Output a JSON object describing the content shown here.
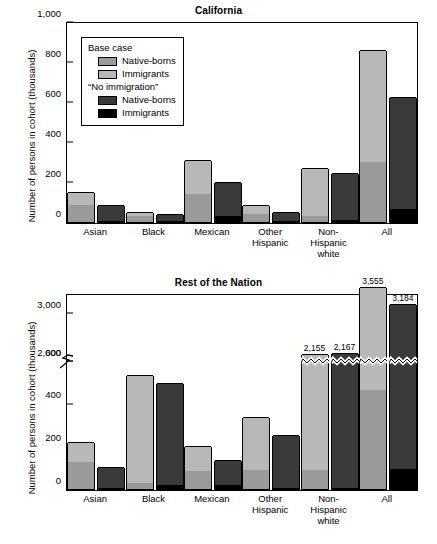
{
  "figure": {
    "ylabel": "Number of persons in cohort (thousands)"
  },
  "legend": {
    "group1_label": "Base case",
    "group1_items": [
      {
        "label": "Native-borns",
        "color": "#9a9a9a",
        "name": "legend-base-native-borns"
      },
      {
        "label": "Immigrants",
        "color": "#b8b8b8",
        "name": "legend-base-immigrants"
      }
    ],
    "group2_label": "“No immigration”",
    "group2_items": [
      {
        "label": "Native-borns",
        "color": "#3a3a3a",
        "name": "legend-noimm-native-borns"
      },
      {
        "label": "Immigrants",
        "color": "#000000",
        "name": "legend-noimm-immigrants"
      }
    ]
  },
  "chart_data": [
    {
      "id": "california",
      "type": "bar",
      "subtype": "grouped-stacked",
      "title": "California",
      "xlabel": "",
      "ylabel": "Number of persons in cohort (thousands)",
      "ylim": [
        0,
        1000
      ],
      "yticks": [
        0,
        200,
        400,
        600,
        800,
        1000
      ],
      "ytick_labels": [
        "0",
        "200",
        "400",
        "600",
        "800",
        "1,000"
      ],
      "grid": false,
      "axis_break": false,
      "categories": [
        "Asian",
        "Black",
        "Mexican",
        "Other\nHispanic",
        "Non-\nHispanic\nwhite",
        "All"
      ],
      "series": [
        {
          "name": "Base case: Native-borns",
          "color": "#9a9a9a",
          "values": [
            85,
            30,
            140,
            40,
            30,
            300
          ]
        },
        {
          "name": "Base case: Immigrants",
          "color": "#b8b8b8",
          "values": [
            65,
            20,
            170,
            45,
            240,
            560
          ]
        },
        {
          "name": "“No immigration”: Native-borns",
          "color": "#3a3a3a",
          "values": [
            78,
            35,
            170,
            47,
            235,
            560
          ]
        },
        {
          "name": "“No immigration”: Immigrants",
          "color": "#000000",
          "values": [
            5,
            3,
            30,
            4,
            8,
            65
          ]
        }
      ],
      "bar_totals": {
        "base_case": [
          150,
          50,
          310,
          85,
          270,
          860
        ],
        "no_immigration": [
          83,
          38,
          200,
          51,
          243,
          625
        ]
      },
      "data_labels": []
    },
    {
      "id": "rest-of-nation",
      "type": "bar",
      "subtype": "grouped-stacked",
      "title": "Rest of the Nation",
      "xlabel": "",
      "ylabel": "Number of persons in cohort (thousands)",
      "ylim": [
        0,
        3400
      ],
      "yticks": [
        0,
        200,
        400,
        600,
        2000,
        3000
      ],
      "ytick_labels": [
        "0",
        "200",
        "400",
        "600",
        "2,000",
        "3,000"
      ],
      "grid": false,
      "axis_break": true,
      "axis_break_range": [
        600,
        2000
      ],
      "categories": [
        "Asian",
        "Black",
        "Mexican",
        "Other\nHispanic",
        "Non-\nHispanic\nwhite",
        "All"
      ],
      "series": [
        {
          "name": "Base case: Native-borns",
          "color": "#9a9a9a",
          "values": [
            125,
            30,
            85,
            90,
            90,
            465
          ]
        },
        {
          "name": "Base case: Immigrants",
          "color": "#b8b8b8",
          "values": [
            95,
            505,
            118,
            248,
            2065,
            3090
          ]
        },
        {
          "name": "“No immigration”: Native-borns",
          "color": "#3a3a3a",
          "values": [
            100,
            480,
            120,
            250,
            2160,
            3090
          ]
        },
        {
          "name": "“No immigration”: Immigrants",
          "color": "#000000",
          "values": [
            3,
            20,
            18,
            3,
            7,
            94
          ]
        }
      ],
      "bar_totals": {
        "base_case": [
          220,
          535,
          203,
          338,
          2155,
          3555
        ],
        "no_immigration": [
          103,
          500,
          138,
          253,
          2167,
          3184
        ]
      },
      "data_labels": [
        {
          "category": "Non-\nHispanic\nwhite",
          "bar": "base_case",
          "text": "2,155"
        },
        {
          "category": "Non-\nHispanic\nwhite",
          "bar": "no_immigration",
          "text": "2,167"
        },
        {
          "category": "All",
          "bar": "base_case",
          "text": "3,555"
        },
        {
          "category": "All",
          "bar": "no_immigration",
          "text": "3,184"
        }
      ]
    }
  ]
}
